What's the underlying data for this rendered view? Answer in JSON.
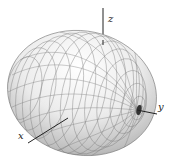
{
  "figure": {
    "type": "3d-surface-plot",
    "axes": {
      "x": {
        "label": "x"
      },
      "y": {
        "label": "y"
      },
      "z": {
        "label": "z"
      }
    },
    "colors": {
      "surface_light": "#f4f4f4",
      "surface_dark": "#8a8a8a",
      "mesh": "#6e6e6e",
      "axis": "#222222"
    }
  }
}
